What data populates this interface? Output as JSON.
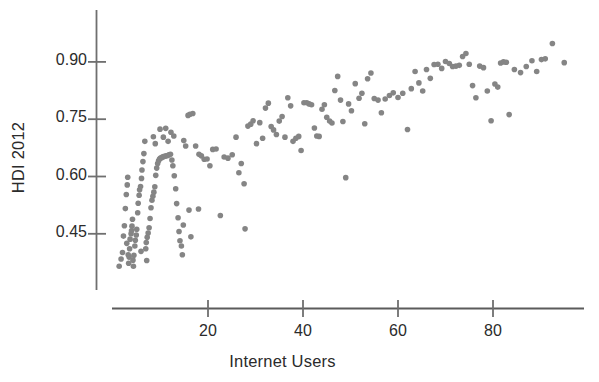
{
  "chart_data": {
    "type": "scatter",
    "title": "",
    "xlabel": "Internet Users",
    "ylabel": "HDI 2012",
    "xlim": [
      0,
      97
    ],
    "ylim": [
      0.345,
      0.975
    ],
    "xticks": [
      20,
      40,
      60,
      80
    ],
    "xtick_labels": [
      "20",
      "40",
      "60",
      "80"
    ],
    "yticks": [
      0.45,
      0.6,
      0.75,
      0.9
    ],
    "ytick_labels": [
      "0.45",
      "0.60",
      "0.75",
      "0.90"
    ],
    "grid": false,
    "legend": null,
    "marker_color": "#858585",
    "marker_size": 5.6,
    "axis_color": "#6f6f6f",
    "n_points": 178,
    "points": [
      [
        1.3,
        0.365
      ],
      [
        1.7,
        0.384
      ],
      [
        2.0,
        0.401
      ],
      [
        2.2,
        0.444
      ],
      [
        2.4,
        0.471
      ],
      [
        2.6,
        0.516
      ],
      [
        2.8,
        0.553
      ],
      [
        3.0,
        0.578
      ],
      [
        3.1,
        0.598
      ],
      [
        3.3,
        0.373
      ],
      [
        3.4,
        0.389
      ],
      [
        3.5,
        0.411
      ],
      [
        3.6,
        0.436
      ],
      [
        3.8,
        0.45
      ],
      [
        3.9,
        0.458
      ],
      [
        4.0,
        0.47
      ],
      [
        4.1,
        0.488
      ],
      [
        4.2,
        0.381
      ],
      [
        4.4,
        0.394
      ],
      [
        4.6,
        0.418
      ],
      [
        4.7,
        0.433
      ],
      [
        4.9,
        0.447
      ],
      [
        5.0,
        0.462
      ],
      [
        5.2,
        0.505
      ],
      [
        5.3,
        0.53
      ],
      [
        5.5,
        0.551
      ],
      [
        5.6,
        0.565
      ],
      [
        5.8,
        0.574
      ],
      [
        6.0,
        0.595
      ],
      [
        6.1,
        0.617
      ],
      [
        6.3,
        0.639
      ],
      [
        6.5,
        0.66
      ],
      [
        6.7,
        0.692
      ],
      [
        6.9,
        0.411
      ],
      [
        7.0,
        0.427
      ],
      [
        7.2,
        0.441
      ],
      [
        7.4,
        0.452
      ],
      [
        7.6,
        0.466
      ],
      [
        7.8,
        0.49
      ],
      [
        8.0,
        0.518
      ],
      [
        8.2,
        0.538
      ],
      [
        8.4,
        0.548
      ],
      [
        8.6,
        0.559
      ],
      [
        8.8,
        0.573
      ],
      [
        9.0,
        0.603
      ],
      [
        9.2,
        0.622
      ],
      [
        9.4,
        0.634
      ],
      [
        9.6,
        0.641
      ],
      [
        9.8,
        0.646
      ],
      [
        10.0,
        0.648
      ],
      [
        10.3,
        0.65
      ],
      [
        10.6,
        0.652
      ],
      [
        10.9,
        0.653
      ],
      [
        11.2,
        0.654
      ],
      [
        11.5,
        0.655
      ],
      [
        11.8,
        0.657
      ],
      [
        12.1,
        0.658
      ],
      [
        12.4,
        0.643
      ],
      [
        12.6,
        0.628
      ],
      [
        12.9,
        0.602
      ],
      [
        13.2,
        0.568
      ],
      [
        13.4,
        0.529
      ],
      [
        13.7,
        0.492
      ],
      [
        13.9,
        0.456
      ],
      [
        14.1,
        0.432
      ],
      [
        14.4,
        0.418
      ],
      [
        14.6,
        0.395
      ],
      [
        5.9,
        0.404
      ],
      [
        7.1,
        0.38
      ],
      [
        4.3,
        0.365
      ],
      [
        3.2,
        0.395
      ],
      [
        2.9,
        0.425
      ],
      [
        10.6,
        0.703
      ],
      [
        11.1,
        0.726
      ],
      [
        11.6,
        0.692
      ],
      [
        12.2,
        0.716
      ],
      [
        12.8,
        0.706
      ],
      [
        9.9,
        0.724
      ],
      [
        8.9,
        0.686
      ],
      [
        8.5,
        0.704
      ],
      [
        14.9,
        0.694
      ],
      [
        15.3,
        0.68
      ],
      [
        15.8,
        0.76
      ],
      [
        16.2,
        0.763
      ],
      [
        16.8,
        0.765
      ],
      [
        17.4,
        0.68
      ],
      [
        18.1,
        0.658
      ],
      [
        18.6,
        0.654
      ],
      [
        19.2,
        0.645
      ],
      [
        19.8,
        0.646
      ],
      [
        20.4,
        0.628
      ],
      [
        21.0,
        0.671
      ],
      [
        21.7,
        0.672
      ],
      [
        16.0,
        0.512
      ],
      [
        18.0,
        0.515
      ],
      [
        14.8,
        0.473
      ],
      [
        16.4,
        0.442
      ],
      [
        22.6,
        0.498
      ],
      [
        23.4,
        0.651
      ],
      [
        24.2,
        0.648
      ],
      [
        25.1,
        0.657
      ],
      [
        25.9,
        0.703
      ],
      [
        26.5,
        0.61
      ],
      [
        27.0,
        0.634
      ],
      [
        27.6,
        0.581
      ],
      [
        27.8,
        0.463
      ],
      [
        28.4,
        0.732
      ],
      [
        29.0,
        0.737
      ],
      [
        29.5,
        0.746
      ],
      [
        30.2,
        0.686
      ],
      [
        30.9,
        0.741
      ],
      [
        31.5,
        0.7
      ],
      [
        32.1,
        0.779
      ],
      [
        32.7,
        0.792
      ],
      [
        33.3,
        0.731
      ],
      [
        33.8,
        0.722
      ],
      [
        34.4,
        0.71
      ],
      [
        35.0,
        0.745
      ],
      [
        35.6,
        0.757
      ],
      [
        36.2,
        0.703
      ],
      [
        36.8,
        0.806
      ],
      [
        37.4,
        0.785
      ],
      [
        37.9,
        0.692
      ],
      [
        38.5,
        0.7
      ],
      [
        39.1,
        0.705
      ],
      [
        39.6,
        0.668
      ],
      [
        40.2,
        0.793
      ],
      [
        40.8,
        0.793
      ],
      [
        41.3,
        0.79
      ],
      [
        41.8,
        0.788
      ],
      [
        42.4,
        0.727
      ],
      [
        42.9,
        0.706
      ],
      [
        43.4,
        0.705
      ],
      [
        44.0,
        0.776
      ],
      [
        44.5,
        0.788
      ],
      [
        45.0,
        0.755
      ],
      [
        45.6,
        0.745
      ],
      [
        46.1,
        0.74
      ],
      [
        46.7,
        0.825
      ],
      [
        47.3,
        0.862
      ],
      [
        47.9,
        0.8
      ],
      [
        48.4,
        0.744
      ],
      [
        49.0,
        0.597
      ],
      [
        49.6,
        0.79
      ],
      [
        50.2,
        0.772
      ],
      [
        51.0,
        0.843
      ],
      [
        51.8,
        0.805
      ],
      [
        52.4,
        0.818
      ],
      [
        53.0,
        0.738
      ],
      [
        53.6,
        0.856
      ],
      [
        54.3,
        0.871
      ],
      [
        55.0,
        0.804
      ],
      [
        55.8,
        0.8
      ],
      [
        56.5,
        0.767
      ],
      [
        57.3,
        0.803
      ],
      [
        58.2,
        0.812
      ],
      [
        59.0,
        0.819
      ],
      [
        60.0,
        0.807
      ],
      [
        61.0,
        0.818
      ],
      [
        62.0,
        0.723
      ],
      [
        62.8,
        0.83
      ],
      [
        63.6,
        0.875
      ],
      [
        64.4,
        0.845
      ],
      [
        65.2,
        0.824
      ],
      [
        66.0,
        0.88
      ],
      [
        66.8,
        0.857
      ],
      [
        67.6,
        0.893
      ],
      [
        68.4,
        0.894
      ],
      [
        69.2,
        0.883
      ],
      [
        70.0,
        0.901
      ],
      [
        70.8,
        0.896
      ],
      [
        71.5,
        0.888
      ],
      [
        72.2,
        0.889
      ],
      [
        72.9,
        0.891
      ],
      [
        73.6,
        0.914
      ],
      [
        74.3,
        0.922
      ],
      [
        75.0,
        0.894
      ],
      [
        75.7,
        0.838
      ],
      [
        76.4,
        0.806
      ],
      [
        77.2,
        0.889
      ],
      [
        78.0,
        0.885
      ],
      [
        78.8,
        0.824
      ],
      [
        79.6,
        0.746
      ],
      [
        80.4,
        0.842
      ],
      [
        81.0,
        0.834
      ],
      [
        81.6,
        0.897
      ],
      [
        82.2,
        0.9
      ],
      [
        82.8,
        0.899
      ],
      [
        83.4,
        0.762
      ],
      [
        84.5,
        0.88
      ],
      [
        85.8,
        0.872
      ],
      [
        87.0,
        0.888
      ],
      [
        88.2,
        0.903
      ],
      [
        89.2,
        0.875
      ],
      [
        90.2,
        0.906
      ],
      [
        91.0,
        0.908
      ],
      [
        92.5,
        0.948
      ],
      [
        95.0,
        0.898
      ]
    ]
  },
  "top_partial_text": ""
}
